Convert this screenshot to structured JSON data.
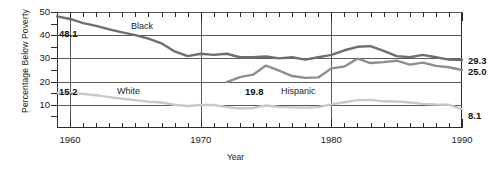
{
  "chart_data": {
    "type": "line",
    "title": "",
    "xlabel": "Year",
    "ylabel": "Percentage Below Poverty",
    "xlim": [
      1959,
      1990
    ],
    "ylim": [
      0,
      50
    ],
    "yticks": [
      10,
      20,
      30,
      40,
      50
    ],
    "ytick_labels": [
      "10",
      "20",
      "30",
      "40",
      "50"
    ],
    "xticks_major": [
      1960,
      1970,
      1980,
      1990
    ],
    "xtick_labels": [
      "1960",
      "1970",
      "1980",
      "1990"
    ],
    "xtick_minor_step": 1,
    "grid": "horizontal-and-decade-vertical",
    "legend": "inline-annotations",
    "series": [
      {
        "name": "Black",
        "color": "#6e6e6e",
        "label_text": "Black",
        "start_value_label": "48.1",
        "end_value_label": "29.3",
        "x": [
          1959,
          1960,
          1961,
          1962,
          1963,
          1964,
          1965,
          1966,
          1967,
          1968,
          1969,
          1970,
          1971,
          1972,
          1973,
          1974,
          1975,
          1976,
          1977,
          1978,
          1979,
          1980,
          1981,
          1982,
          1983,
          1984,
          1985,
          1986,
          1987,
          1988,
          1989,
          1990
        ],
        "y": [
          48.1,
          47.0,
          45.2,
          44.0,
          42.5,
          41.2,
          40.0,
          38.5,
          36.5,
          33.0,
          31.0,
          32.0,
          31.5,
          32.0,
          30.5,
          30.5,
          30.8,
          30.0,
          30.5,
          29.5,
          30.5,
          31.5,
          33.5,
          35.0,
          35.3,
          33.2,
          31.0,
          30.5,
          31.5,
          30.5,
          29.5,
          29.3
        ]
      },
      {
        "name": "White",
        "color": "#c9c9c9",
        "label_text": "White",
        "start_value_label": "15.2",
        "end_value_label": "8.1",
        "x": [
          1959,
          1960,
          1961,
          1962,
          1963,
          1964,
          1965,
          1966,
          1967,
          1968,
          1969,
          1970,
          1971,
          1972,
          1973,
          1974,
          1975,
          1976,
          1977,
          1978,
          1979,
          1980,
          1981,
          1982,
          1983,
          1984,
          1985,
          1986,
          1987,
          1988,
          1989,
          1990
        ],
        "y": [
          15.2,
          15.0,
          14.7,
          14.1,
          13.3,
          12.6,
          12.0,
          11.3,
          11.0,
          10.0,
          9.5,
          9.9,
          9.9,
          9.0,
          8.4,
          8.6,
          9.7,
          9.1,
          8.9,
          8.7,
          9.0,
          10.2,
          11.1,
          12.0,
          12.1,
          11.5,
          11.4,
          11.0,
          10.4,
          10.1,
          10.0,
          8.1
        ]
      },
      {
        "name": "Hispanic",
        "color": "#8e8e8e",
        "label_text": "Hispanic",
        "start_value_label": "19.8",
        "end_value_label": "25.0",
        "x": [
          1972,
          1973,
          1974,
          1975,
          1976,
          1977,
          1978,
          1979,
          1980,
          1981,
          1982,
          1983,
          1984,
          1985,
          1986,
          1987,
          1988,
          1989,
          1990
        ],
        "y": [
          19.8,
          21.9,
          23.0,
          26.9,
          24.7,
          22.4,
          21.6,
          21.8,
          25.7,
          26.5,
          29.9,
          28.0,
          28.4,
          29.0,
          27.3,
          28.2,
          26.8,
          26.2,
          25.0
        ]
      }
    ],
    "annotations": [
      {
        "name": "black-series-label",
        "text": "Black"
      },
      {
        "name": "white-series-label",
        "text": "White"
      },
      {
        "name": "hispanic-series-label",
        "text": "Hispanic"
      },
      {
        "name": "black-start-value",
        "text": "48.1"
      },
      {
        "name": "white-start-value",
        "text": "15.2"
      },
      {
        "name": "hispanic-start-value",
        "text": "19.8"
      },
      {
        "name": "black-end-value",
        "text": "29.3"
      },
      {
        "name": "hispanic-end-value",
        "text": "25.0"
      },
      {
        "name": "white-end-value",
        "text": "8.1"
      }
    ]
  }
}
